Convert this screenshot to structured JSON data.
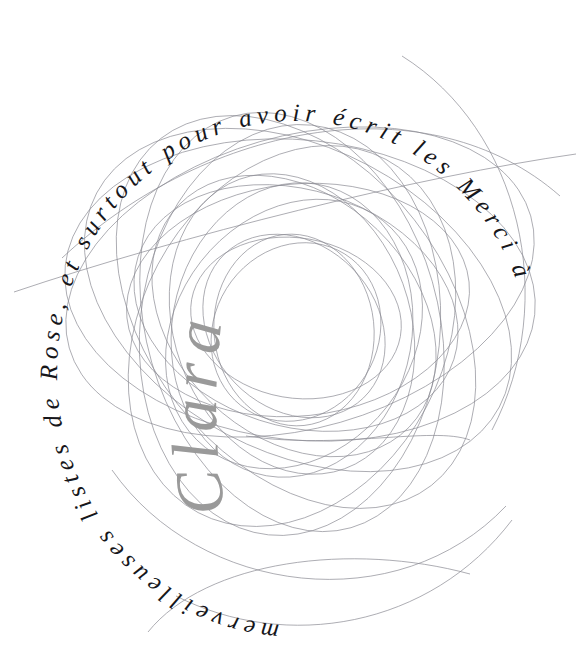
{
  "canvas": {
    "width": 587,
    "height": 668,
    "background_color": "#ffffff"
  },
  "artwork": {
    "title": "Circular dedication with overlapping elliptical curves",
    "style": "generative line art, text on circular paths",
    "ink_color": "#16161a",
    "curve_color": "#8a8a92",
    "signature_color": "#9a9a9a"
  },
  "text_rings": {
    "outer": {
      "full_phrase": "Merci à Clara pour l'inspiration, et surtout pour avoir écrit les merveilleuses listes de Rose.",
      "segments": [
        {
          "id": "seg-outer-a",
          "text": "Merci à"
        },
        {
          "id": "seg-outer-b",
          "text": "pour avoir écrit les"
        },
        {
          "id": "seg-outer-c",
          "text": "merveilleuses listes de Rose."
        },
        {
          "id": "seg-outer-d",
          "text": ", et surtout"
        }
      ],
      "rendered_text": "merveilleuses listes de Rose, et surtout pour avoir écrit les Merci à"
    },
    "inner": {
      "full_phrase": "pour l'inspiration",
      "rendered_text": "pour l'inspiration"
    }
  },
  "signature": {
    "name": "Clara",
    "color": "#9a9a9a"
  },
  "words": {
    "merci": "Merci",
    "a": "à",
    "clara": "Clara",
    "pour": "pour",
    "linspiration": "l'inspiration,",
    "et": "et",
    "surtout": "surtout",
    "pour2": "pour",
    "avoir": "avoir",
    "ecrit": "écrit",
    "les": "les",
    "merveilleuses": "merveilleuses",
    "listes": "listes",
    "de": "de",
    "rose": "Rose."
  }
}
